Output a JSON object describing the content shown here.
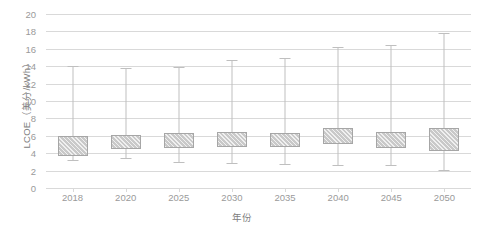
{
  "chart_data": {
    "type": "bar",
    "subtype": "box-and-whisker",
    "title": "",
    "xlabel": "年份",
    "ylabel": "LCOE（美分/kWh）",
    "categories": [
      "2018",
      "2020",
      "2025",
      "2030",
      "2035",
      "2040",
      "2045",
      "2050"
    ],
    "ylim": [
      0,
      20
    ],
    "ytick_step": 2,
    "yticks": [
      "20",
      "18",
      "16",
      "14",
      "12",
      "10",
      "8",
      "6",
      "4",
      "2",
      "0"
    ],
    "grid": true,
    "legend": "none",
    "series": [
      {
        "name": "LCOE range",
        "whisker_low": [
          3.2,
          3.4,
          3.0,
          2.9,
          2.8,
          2.6,
          2.6,
          2.1
        ],
        "box_low": [
          3.7,
          4.5,
          4.6,
          4.7,
          4.7,
          5.0,
          4.6,
          4.2
        ],
        "box_high": [
          6.0,
          6.1,
          6.3,
          6.4,
          6.3,
          6.9,
          6.4,
          6.9
        ],
        "whisker_high": [
          14.0,
          13.8,
          13.9,
          14.7,
          15.0,
          16.2,
          16.4,
          17.8
        ]
      }
    ]
  }
}
